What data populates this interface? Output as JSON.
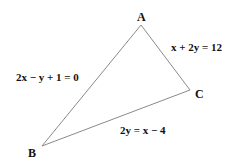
{
  "diagram": {
    "type": "triangle",
    "vertices": [
      {
        "name": "A",
        "x": 141,
        "y": 25,
        "label_x": 137,
        "label_y": 21
      },
      {
        "name": "B",
        "x": 42,
        "y": 146,
        "label_x": 28,
        "label_y": 157
      },
      {
        "name": "C",
        "x": 190,
        "y": 90,
        "label_x": 195,
        "label_y": 98
      }
    ],
    "sides": [
      {
        "between": "AB",
        "equation": "2x − y + 1 = 0",
        "label_x": 16,
        "label_y": 81
      },
      {
        "between": "AC",
        "equation": "x + 2y = 12",
        "label_x": 171,
        "label_y": 51
      },
      {
        "between": "BC",
        "equation": "2y = x − 4",
        "label_x": 120,
        "label_y": 134
      }
    ],
    "colors": {
      "line": "#888888",
      "text": "#111111",
      "background": "#ffffff"
    }
  }
}
